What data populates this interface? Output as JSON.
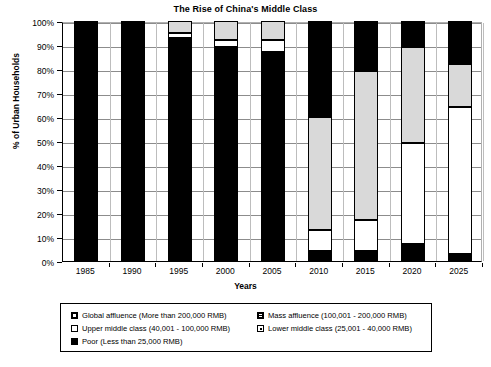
{
  "chart_data": {
    "type": "bar",
    "subtype": "stacked-column-100",
    "title": "The Rise of China's Middle Class",
    "xlabel": "Years",
    "ylabel": "% of Urban Households",
    "ylim": [
      0,
      100
    ],
    "ytick_labels": [
      "0%",
      "10%",
      "20%",
      "30%",
      "40%",
      "50%",
      "60%",
      "70%",
      "80%",
      "90%",
      "100%"
    ],
    "ytick_values": [
      0,
      10,
      20,
      30,
      40,
      50,
      60,
      70,
      80,
      90,
      100
    ],
    "grid": true,
    "legend_position": "bottom",
    "categories": [
      "1985",
      "1990",
      "1995",
      "2000",
      "2005",
      "2010",
      "2015",
      "2020",
      "2025"
    ],
    "series": [
      {
        "name": "Poor (Less than 25,000 RMB)",
        "key": "poor",
        "color": "#000000",
        "pattern": "solid",
        "values": [
          100,
          100,
          93,
          89,
          87,
          4,
          4,
          7,
          3
        ]
      },
      {
        "name": "Lower middle class (25,001 - 40,000 RMB)",
        "key": "lower",
        "color": "#ffffff",
        "pattern": "white-dotted",
        "values": [
          0,
          0,
          2,
          3,
          5,
          9,
          13,
          42,
          61
        ]
      },
      {
        "name": "Upper middle class (40,001 - 100,000 RMB)",
        "key": "upper",
        "color": "#d9d9d9",
        "pattern": "light-gray",
        "values": [
          0,
          0,
          5,
          8,
          8,
          47,
          62,
          40,
          18
        ]
      },
      {
        "name": "Mass affluence (100,001 - 200,000 RMB)",
        "key": "mass",
        "color": "#000000",
        "pattern": "hatched-black",
        "values": [
          0,
          0,
          0,
          0,
          0,
          33,
          17,
          9,
          14
        ]
      },
      {
        "name": "Global affluence (More than 200,000 RMB)",
        "key": "global",
        "color": "#000000",
        "pattern": "black-white-center",
        "values": [
          0,
          0,
          0,
          0,
          0,
          7,
          4,
          2,
          4
        ]
      }
    ]
  },
  "legend": {
    "entries": [
      {
        "label": "Global affluence (More than 200,000 RMB)",
        "swatch": "sw-global"
      },
      {
        "label": "Mass affluence (100,001 - 200,000 RMB)",
        "swatch": "sw-mass"
      },
      {
        "label": "Upper middle class (40,001 - 100,000 RMB)",
        "swatch": "sw-upper"
      },
      {
        "label": "Lower middle class (25,001 - 40,000 RMB)",
        "swatch": "sw-lower"
      },
      {
        "label": "Poor (Less than 25,000 RMB)",
        "swatch": "sw-poor"
      }
    ]
  }
}
